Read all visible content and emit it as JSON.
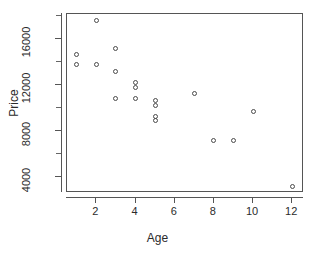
{
  "chart_data": {
    "type": "scatter",
    "title": "",
    "xlabel": "Age",
    "ylabel": "Price",
    "xlim": [
      0.5,
      12.6
    ],
    "ylim": [
      2600,
      18200
    ],
    "grid": false,
    "legend": null,
    "x_ticks": [
      2,
      4,
      6,
      8,
      10,
      12
    ],
    "x_tick_labels": [
      "2",
      "4",
      "6",
      "8",
      "10",
      "12"
    ],
    "y_ticks": [
      4000,
      8000,
      12000,
      16000
    ],
    "y_tick_labels": [
      "4000",
      "8000",
      "12000",
      "16000"
    ],
    "y_minor_ticks": [
      6000,
      10000,
      14000,
      18000
    ],
    "marker": "open-circle",
    "marker_color": "#4a4a4a",
    "points": [
      {
        "x": 1,
        "y": 14700
      },
      {
        "x": 1,
        "y": 13800
      },
      {
        "x": 2,
        "y": 17600
      },
      {
        "x": 2,
        "y": 13800
      },
      {
        "x": 3,
        "y": 15200
      },
      {
        "x": 3,
        "y": 13200
      },
      {
        "x": 3,
        "y": 10800
      },
      {
        "x": 4,
        "y": 12200
      },
      {
        "x": 4,
        "y": 11800
      },
      {
        "x": 4,
        "y": 10800
      },
      {
        "x": 5,
        "y": 10700
      },
      {
        "x": 5,
        "y": 10200
      },
      {
        "x": 5,
        "y": 9300
      },
      {
        "x": 5,
        "y": 8900
      },
      {
        "x": 7,
        "y": 11300
      },
      {
        "x": 8,
        "y": 7200
      },
      {
        "x": 9,
        "y": 7200
      },
      {
        "x": 10,
        "y": 9700
      },
      {
        "x": 12,
        "y": 3200
      }
    ]
  }
}
